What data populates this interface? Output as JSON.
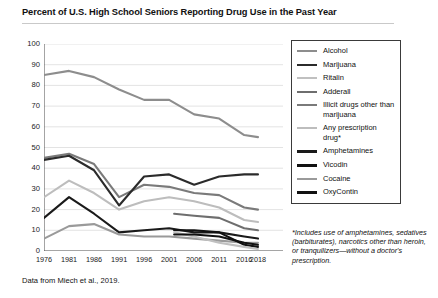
{
  "title": "Percent of U.S. High School Seniors Reporting Drug Use in the Past Year",
  "source": "Data from Miech et al., 2019.",
  "footnote": "*Includes use of amphetamines, sedatives (barbiturates), narcotics other than heroin, or tranquilizers—without a doctor's prescription.",
  "legend": {
    "items": [
      {
        "label": "Alcohol",
        "color": "#8d8d8d"
      },
      {
        "label": "Marijuana",
        "color": "#2b2b2b"
      },
      {
        "label": "Ritalin",
        "color": "#c0c0c0"
      },
      {
        "label": "Adderall",
        "color": "#6e6e6e"
      },
      {
        "label": "Illicit drugs other than marijuana",
        "color": "#7a7a7a"
      },
      {
        "label": "Any prescription drug*",
        "color": "#bdbdbd"
      },
      {
        "label": "Amphetamines",
        "color": "#1a1a1a"
      },
      {
        "label": "Vicodin",
        "color": "#111111"
      },
      {
        "label": "Cocaine",
        "color": "#9a9a9a"
      },
      {
        "label": "OxyContin",
        "color": "#111111"
      }
    ]
  },
  "chart_data": {
    "type": "line",
    "title": "Percent of U.S. High School Seniors Reporting Drug Use in the Past Year",
    "xlabel": "",
    "ylabel": "",
    "ylim": [
      0,
      100
    ],
    "ytick_step": 10,
    "yticks": [
      0,
      10,
      20,
      30,
      40,
      50,
      60,
      70,
      80,
      90,
      100
    ],
    "xticks": [
      1976,
      1981,
      1986,
      1991,
      1996,
      2001,
      2006,
      2011,
      2016,
      2018
    ],
    "xlim": [
      1976,
      2018
    ],
    "grid": "horizontal",
    "legend_position": "right",
    "series": [
      {
        "name": "Alcohol",
        "color": "#8d8d8d",
        "width": 2.1,
        "x": [
          1976,
          1981,
          1986,
          1991,
          1996,
          2001,
          2006,
          2011,
          2016,
          2018
        ],
        "values": [
          85,
          87,
          84,
          78,
          73,
          73,
          66,
          64,
          56,
          55
        ]
      },
      {
        "name": "Illicit drugs other than marijuana",
        "color": "#7a7a7a",
        "width": 2.1,
        "x": [
          1976,
          1981,
          1986,
          1991,
          1996,
          2001,
          2006,
          2011,
          2016,
          2018
        ],
        "values": [
          45,
          47,
          42,
          26,
          32,
          31,
          28,
          27,
          21,
          20
        ]
      },
      {
        "name": "Marijuana",
        "color": "#2b2b2b",
        "width": 2.1,
        "x": [
          1976,
          1981,
          1986,
          1991,
          1996,
          2001,
          2006,
          2011,
          2016,
          2018
        ],
        "values": [
          44,
          46,
          39,
          22,
          36,
          37,
          32,
          36,
          37,
          37
        ]
      },
      {
        "name": "Any prescription drug*",
        "color": "#bdbdbd",
        "width": 2.1,
        "x": [
          1976,
          1981,
          1986,
          1991,
          1996,
          2001,
          2006,
          2011,
          2016,
          2018
        ],
        "values": [
          26,
          34,
          28,
          20,
          24,
          26,
          24,
          21,
          15,
          14
        ]
      },
      {
        "name": "Amphetamines",
        "color": "#1a1a1a",
        "width": 2.1,
        "x": [
          1976,
          1981,
          1986,
          1991,
          1996,
          2001,
          2006,
          2011,
          2016,
          2018
        ],
        "values": [
          16,
          26,
          18,
          9,
          10,
          11,
          9,
          9,
          7,
          6
        ]
      },
      {
        "name": "Cocaine",
        "color": "#9a9a9a",
        "width": 2.1,
        "x": [
          1976,
          1981,
          1986,
          1991,
          1996,
          2001,
          2006,
          2011,
          2016,
          2018
        ],
        "values": [
          6,
          12,
          13,
          8,
          7,
          7,
          6,
          5,
          4,
          4
        ]
      },
      {
        "name": "Adderall",
        "color": "#6e6e6e",
        "width": 2.1,
        "x": [
          2002,
          2006,
          2011,
          2016,
          2018
        ],
        "values": [
          18,
          17,
          16,
          11,
          10
        ]
      },
      {
        "name": "Vicodin",
        "color": "#111111",
        "width": 2.1,
        "x": [
          2002,
          2006,
          2011,
          2016,
          2018
        ],
        "values": [
          10,
          10,
          9,
          3,
          2
        ]
      },
      {
        "name": "Ritalin",
        "color": "#c0c0c0",
        "width": 2.1,
        "x": [
          2002,
          2006,
          2011,
          2016,
          2018
        ],
        "values": [
          9,
          7,
          4,
          2,
          1
        ]
      },
      {
        "name": "OxyContin",
        "color": "#111111",
        "width": 2.1,
        "x": [
          2002,
          2006,
          2011,
          2016,
          2018
        ],
        "values": [
          8,
          8,
          7,
          4,
          3
        ]
      }
    ]
  }
}
